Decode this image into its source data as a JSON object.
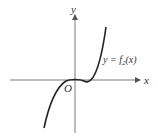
{
  "diagram": {
    "type": "function-graph",
    "axes": {
      "x_label": "x",
      "y_label": "y",
      "origin_label": "O"
    },
    "curve": {
      "label": "y = f",
      "subscript": "2",
      "label_suffix": "(x)",
      "shape": "cubic-like, flat at origin, increasing"
    },
    "colors": {
      "axis": "#7a7a7a",
      "curve": "#222222",
      "text": "#333333"
    }
  }
}
